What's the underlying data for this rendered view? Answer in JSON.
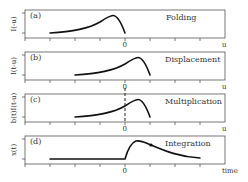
{
  "figure": {
    "panels": [
      {
        "id": "a",
        "tag": "(a)",
        "title": "Folding",
        "ylabel": "I(-u)",
        "xlabel": "u",
        "zero_label": "0"
      },
      {
        "id": "b",
        "tag": "(b)",
        "title": "Displacement",
        "ylabel": "I(t-u)",
        "xlabel": "u",
        "zero_label": "0"
      },
      {
        "id": "c",
        "tag": "(c)",
        "title": "Multiplication",
        "ylabel": "b(t)I(t-u)",
        "xlabel": "u",
        "zero_label": "0"
      },
      {
        "id": "d",
        "tag": "(d)",
        "title": "Integration",
        "ylabel": "x(t)",
        "xlabel": "time",
        "zero_label": "0"
      }
    ]
  }
}
